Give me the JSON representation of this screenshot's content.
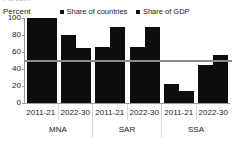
{
  "top_remnant": "Percent",
  "chart_data": {
    "type": "bar",
    "title": "",
    "ylabel": "Percent",
    "xlabel": "",
    "ylim": [
      0,
      100
    ],
    "yticks": [
      0,
      20,
      40,
      60,
      80,
      100
    ],
    "grid": false,
    "legend_position": "top",
    "categories": [
      "2011-21",
      "2022-30",
      "2011-21",
      "2022-30",
      "2011-21",
      "2022-30"
    ],
    "groups": [
      {
        "label": "MNA",
        "periods": [
          "2011-21",
          "2022-30"
        ]
      },
      {
        "label": "SAR",
        "periods": [
          "2011-21",
          "2022-30"
        ]
      },
      {
        "label": "SSA",
        "periods": [
          "2011-21",
          "2022-30"
        ]
      }
    ],
    "series": [
      {
        "name": "Share of countries",
        "color": "#0d0d0d",
        "values": [
          100,
          80,
          66,
          66,
          22,
          45
        ]
      },
      {
        "name": "Share of GDP",
        "color": "#0d0d0d",
        "values": [
          100,
          65,
          90,
          90,
          14,
          56
        ]
      }
    ],
    "reference_line": {
      "value": 50,
      "color": "#8c8c8c",
      "label": ""
    }
  },
  "ytick_labels": [
    "100",
    "80",
    "60",
    "40",
    "20",
    "0"
  ],
  "legend": {
    "items": [
      {
        "label": "Share of countries",
        "color": "#0d0d0d"
      },
      {
        "label": "Share of GDP",
        "color": "#0d0d0d"
      }
    ]
  },
  "period_labels": [
    "2011-21",
    "2022-30",
    "2011-21",
    "2022-30",
    "2011-21",
    "2022-30"
  ],
  "region_labels": [
    "MNA",
    "SAR",
    "SSA"
  ]
}
